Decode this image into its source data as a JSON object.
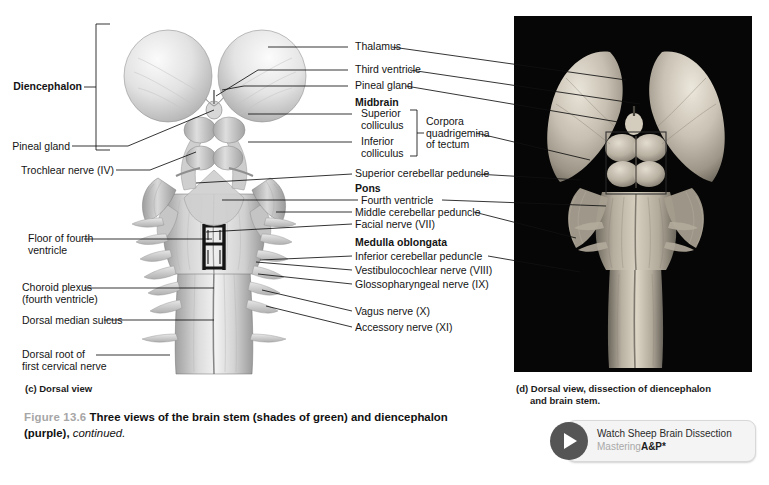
{
  "figure": {
    "number": "Figure 13.6",
    "title_bold_1": "Three views of the brain stem (shades of green) and diencephalon (purple),",
    "title_italic": "continued."
  },
  "panel_c": {
    "caption": "(c) Dorsal view",
    "labels_left": [
      {
        "id": "diencephalon",
        "text": "Diencephalon",
        "bold": true
      },
      {
        "id": "pineal-gland",
        "text": "Pineal gland",
        "bold": false
      },
      {
        "id": "trochlear-nerve",
        "text": "Trochlear nerve (IV)",
        "bold": false
      },
      {
        "id": "floor-of-fourth-ventricle",
        "text": "Floor of fourth\nventricle",
        "bold": false
      },
      {
        "id": "choroid-plexus",
        "text": "Choroid plexus\n(fourth ventricle)",
        "bold": false
      },
      {
        "id": "dorsal-median-sulcus",
        "text": "Dorsal median sulcus",
        "bold": false
      },
      {
        "id": "dorsal-root-first-cervical-nerve",
        "text": "Dorsal root of\nfirst cervical nerve",
        "bold": false
      }
    ],
    "labels_right": [
      {
        "id": "thalamus",
        "text": "Thalamus",
        "bold": false
      },
      {
        "id": "third-ventricle",
        "text": "Third ventricle",
        "bold": false
      },
      {
        "id": "pineal-gland-right",
        "text": "Pineal gland",
        "bold": false
      },
      {
        "id": "midbrain",
        "text": "Midbrain",
        "bold": true
      },
      {
        "id": "superior-colliculus",
        "text": "Superior\ncolliculus",
        "bold": false
      },
      {
        "id": "inferior-colliculus",
        "text": "Inferior\ncolliculus",
        "bold": false
      },
      {
        "id": "corpora-quadrigemina",
        "text": "Corpora\nquadrigemina\nof tectum",
        "bold": false
      },
      {
        "id": "superior-cerebellar-peduncle",
        "text": "Superior cerebellar peduncle",
        "bold": false
      },
      {
        "id": "pons",
        "text": "Pons",
        "bold": true
      },
      {
        "id": "fourth-ventricle",
        "text": "Fourth ventricle",
        "bold": false
      },
      {
        "id": "middle-cerebellar-peduncle",
        "text": "Middle cerebellar peduncle",
        "bold": false
      },
      {
        "id": "facial-nerve",
        "text": "Facial nerve (VII)",
        "bold": false
      },
      {
        "id": "medulla-oblongata",
        "text": "Medulla oblongata",
        "bold": true
      },
      {
        "id": "inferior-cerebellar-peduncle",
        "text": "Inferior cerebellar peduncle",
        "bold": false
      },
      {
        "id": "vestibulocochlear-nerve",
        "text": "Vestibulocochlear nerve (VIII)",
        "bold": false
      },
      {
        "id": "glossopharyngeal-nerve",
        "text": "Glossopharyngeal nerve (IX)",
        "bold": false
      },
      {
        "id": "vagus-nerve",
        "text": "Vagus nerve (X)",
        "bold": false
      },
      {
        "id": "accessory-nerve",
        "text": "Accessory nerve (XI)",
        "bold": false
      }
    ]
  },
  "panel_d": {
    "caption_line1": "(d) Dorsal view, dissection of diencephalon",
    "caption_line2": "and brain stem."
  },
  "video_button": {
    "title": "Watch Sheep Brain Dissection",
    "brand_gray": "Mastering",
    "brand_dark": "A&P*"
  }
}
